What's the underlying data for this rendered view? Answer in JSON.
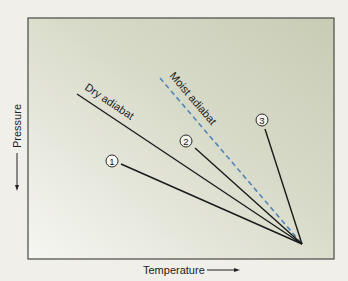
{
  "diagram": {
    "axes": {
      "x_label": "Temperature",
      "y_label": "Pressure"
    },
    "lines": [
      {
        "id": "dry",
        "label": "Dry adiabat",
        "style": "solid",
        "color": "#1a1a1a"
      },
      {
        "id": "moist",
        "label": "Moist adiabat",
        "style": "dashed",
        "color": "#4f86b8"
      },
      {
        "id": "1",
        "label": "1",
        "style": "solid",
        "color": "#1a1a1a"
      },
      {
        "id": "2",
        "label": "2",
        "style": "solid",
        "color": "#1a1a1a"
      },
      {
        "id": "3",
        "label": "3",
        "style": "solid",
        "color": "#1a1a1a"
      }
    ],
    "markers": {
      "m1": "1",
      "m2": "2",
      "m3": "3"
    },
    "colors": {
      "panel_top": "#c9cdb6",
      "panel_bottom": "#f4f4f0",
      "frame": "#55554f",
      "background": "#f1efea"
    }
  }
}
